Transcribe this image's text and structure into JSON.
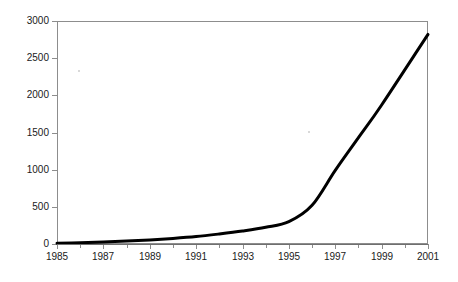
{
  "chart_data": {
    "type": "line",
    "title": "",
    "subtitle": "",
    "xlabel": "",
    "ylabel": "",
    "xlim": [
      1985,
      2001
    ],
    "ylim": [
      0,
      3000
    ],
    "grid": false,
    "legend": false,
    "legend_position": "none",
    "series_color": "#000000",
    "frame_color": "#8d8d8d",
    "x_tick_labels": [
      "1985",
      "1987",
      "1989",
      "1991",
      "1993",
      "1995",
      "1997",
      "1999",
      "2001"
    ],
    "x_tick_values": [
      1985,
      1987,
      1989,
      1991,
      1993,
      1995,
      1997,
      1999,
      2001
    ],
    "x_minor_tick_values": [
      1986,
      1988,
      1990,
      1992,
      1994,
      1996,
      1998,
      2000
    ],
    "y_tick_labels": [
      "0",
      "500",
      "1000",
      "1500",
      "2000",
      "2500",
      "3000"
    ],
    "y_tick_values": [
      0,
      500,
      1000,
      1500,
      2000,
      2500,
      3000
    ],
    "x": [
      1985,
      1986,
      1987,
      1988,
      1989,
      1990,
      1991,
      1992,
      1993,
      1994,
      1995,
      1996,
      1997,
      1998,
      1999,
      2001
    ],
    "values": [
      10,
      18,
      28,
      40,
      55,
      75,
      100,
      135,
      175,
      225,
      300,
      520,
      990,
      1430,
      1870,
      2820
    ],
    "series": [
      {
        "name": "series-1",
        "color": "#000000",
        "values": [
          10,
          18,
          28,
          40,
          55,
          75,
          100,
          135,
          175,
          225,
          300,
          520,
          990,
          1430,
          1870,
          2820
        ]
      }
    ]
  },
  "axes": {
    "y_ticks": [
      {
        "label": "3000",
        "value": 3000
      },
      {
        "label": "2500",
        "value": 2500
      },
      {
        "label": "2000",
        "value": 2000
      },
      {
        "label": "1500",
        "value": 1500
      },
      {
        "label": "1000",
        "value": 1000
      },
      {
        "label": "500",
        "value": 500
      },
      {
        "label": "0",
        "value": 0
      }
    ],
    "x_ticks": [
      {
        "label": "1985",
        "value": 1985
      },
      {
        "label": "1987",
        "value": 1987
      },
      {
        "label": "1989",
        "value": 1989
      },
      {
        "label": "1991",
        "value": 1991
      },
      {
        "label": "1993",
        "value": 1993
      },
      {
        "label": "1995",
        "value": 1995
      },
      {
        "label": "1997",
        "value": 1997
      },
      {
        "label": "1999",
        "value": 1999
      },
      {
        "label": "2001",
        "value": 2001
      }
    ]
  }
}
